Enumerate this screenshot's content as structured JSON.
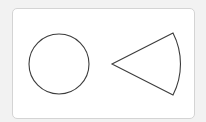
{
  "diagram": {
    "background_color": "#f2f2f2",
    "card": {
      "fill": "#ffffff",
      "border_color": "#d4d4d4"
    },
    "stroke_color": "#3c3c3c",
    "shapes": [
      {
        "name": "circle",
        "cx": 59,
        "cy": 64,
        "r": 30
      },
      {
        "name": "circular-sector",
        "apex": [
          112,
          64
        ],
        "top": [
          173,
          33
        ],
        "bottom": [
          173,
          95
        ],
        "arc_radius": 68
      }
    ]
  }
}
